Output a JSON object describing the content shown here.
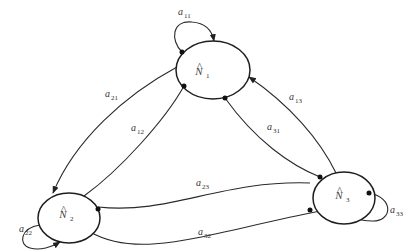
{
  "diagram": {
    "type": "state-transition-graph",
    "nodes": [
      {
        "id": "N1",
        "label": "N",
        "hat": "^",
        "sub": "1"
      },
      {
        "id": "N2",
        "label": "N",
        "hat": "^",
        "sub": "2"
      },
      {
        "id": "N3",
        "label": "N",
        "hat": "^",
        "sub": "3"
      }
    ],
    "edges": [
      {
        "from": "N1",
        "to": "N1",
        "label": "a",
        "sub": "11"
      },
      {
        "from": "N1",
        "to": "N2",
        "label": "a",
        "sub": "21"
      },
      {
        "from": "N2",
        "to": "N1",
        "label": "a",
        "sub": "12"
      },
      {
        "from": "N3",
        "to": "N1",
        "label": "a",
        "sub": "13"
      },
      {
        "from": "N1",
        "to": "N3",
        "label": "a",
        "sub": "31"
      },
      {
        "from": "N2",
        "to": "N2",
        "label": "a",
        "sub": "22"
      },
      {
        "from": "N2",
        "to": "N3",
        "label": "a",
        "sub": "23"
      },
      {
        "from": "N3",
        "to": "N2",
        "label": "a",
        "sub": "32"
      },
      {
        "from": "N3",
        "to": "N3",
        "label": "a",
        "sub": "33"
      }
    ]
  }
}
